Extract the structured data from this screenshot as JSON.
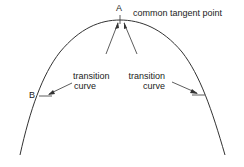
{
  "diagram": {
    "point_a_label": "A",
    "point_b_label": "B",
    "tangent_label": "common tangent point",
    "left_transition": {
      "line1": "transition",
      "line2": "curve"
    },
    "right_transition": {
      "line1": "transition",
      "line2": "curve"
    }
  }
}
